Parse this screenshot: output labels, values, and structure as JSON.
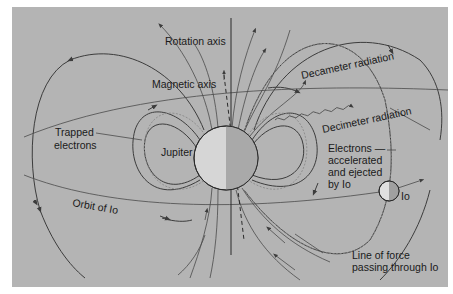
{
  "diagram": {
    "background_color": "#b4b4b4",
    "labels": {
      "rotation_axis": "Rotation axis",
      "magnetic_axis": "Magnetic axis",
      "decameter_radiation": "Decameter radiation",
      "decimeter_radiation": "Decimeter radiation",
      "trapped_electrons_1": "Trapped",
      "trapped_electrons_2": "electrons",
      "jupiter": "Jupiter",
      "electrons_1": "Electrons —",
      "electrons_2": "accelerated",
      "electrons_3": "and ejected",
      "electrons_4": "by Io",
      "io": "Io",
      "orbit_of_io": "Orbit of Io",
      "line_of_force_1": "Line of force",
      "line_of_force_2": "passing through Io"
    },
    "bodies": [
      {
        "name": "Jupiter",
        "cx": 226,
        "cy": 158,
        "r": 32
      },
      {
        "name": "Io",
        "cx": 389,
        "cy": 191,
        "r": 10
      }
    ]
  }
}
